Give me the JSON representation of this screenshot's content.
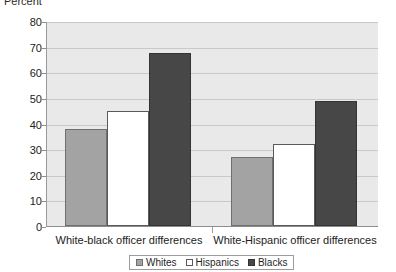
{
  "chart_data": {
    "type": "bar",
    "title": "",
    "subtitle": "",
    "xlabel": "",
    "ylabel": "Percent",
    "ylim": [
      0,
      80
    ],
    "ytick_step": 10,
    "yticks": [
      80,
      70,
      60,
      50,
      40,
      30,
      20,
      10,
      0
    ],
    "grid": true,
    "legend_position": "bottom-center",
    "categories": [
      "White-black officer differences",
      "White-Hispanic officer differences"
    ],
    "series": [
      {
        "name": "Whites",
        "values": [
          38,
          27
        ],
        "color": "#a3a3a3"
      },
      {
        "name": "Hispanics",
        "values": [
          45,
          32
        ],
        "color": "#ffffff"
      },
      {
        "name": "Blacks",
        "values": [
          68,
          49
        ],
        "color": "#474747"
      }
    ]
  },
  "axis": {
    "y_title": "Percent",
    "tick_0": "80",
    "tick_1": "70",
    "tick_2": "60",
    "tick_3": "50",
    "tick_4": "40",
    "tick_5": "30",
    "tick_6": "20",
    "tick_7": "10",
    "tick_8": "0"
  },
  "categories": {
    "cat_0": "White-black officer differences",
    "cat_1": "White-Hispanic officer differences"
  },
  "legend": {
    "item_0": "Whites",
    "item_1": "Hispanics",
    "item_2": "Blacks"
  }
}
